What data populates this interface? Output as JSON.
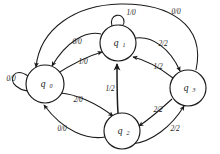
{
  "diagram": {
    "type": "mealy-state-machine",
    "background_color": "#ffffff",
    "stroke_color": "#1a1a1a",
    "states": [
      {
        "id": "q0",
        "label": "q",
        "subscript": "0",
        "cx": 45,
        "cy": 84,
        "r": 19
      },
      {
        "id": "q1",
        "label": "q",
        "subscript": "1",
        "cx": 118,
        "cy": 43,
        "r": 18
      },
      {
        "id": "q2",
        "label": "q",
        "subscript": "2",
        "cx": 122,
        "cy": 131,
        "r": 18
      },
      {
        "id": "q3",
        "label": "q",
        "subscript": "3",
        "cx": 188,
        "cy": 88,
        "r": 18
      }
    ],
    "transitions": [
      {
        "id": "t-q0-q0",
        "from": "q0",
        "to": "q0",
        "label": "0/0",
        "lx": 11,
        "ly": 79
      },
      {
        "id": "t-q1-q1",
        "from": "q1",
        "to": "q1",
        "label": "1/0",
        "lx": 131,
        "ly": 13
      },
      {
        "id": "t-q1-q0",
        "from": "q1",
        "to": "q0",
        "label": "0/0",
        "lx": 77,
        "ly": 42
      },
      {
        "id": "t-q0-q1",
        "from": "q0",
        "to": "q1",
        "label": "1/0",
        "lx": 83,
        "ly": 62
      },
      {
        "id": "t-q1-q3",
        "from": "q1",
        "to": "q3",
        "label": "2/2",
        "lx": 163,
        "ly": 44
      },
      {
        "id": "t-q3-q1",
        "from": "q3",
        "to": "q1",
        "label": "1/2",
        "lx": 158,
        "ly": 67
      },
      {
        "id": "t-q0-q2",
        "from": "q0",
        "to": "q2",
        "label": "2/0",
        "lx": 78,
        "ly": 100
      },
      {
        "id": "t-q2-q0",
        "from": "q2",
        "to": "q0",
        "label": "0/0",
        "lx": 62,
        "ly": 129
      },
      {
        "id": "t-q2-q1",
        "from": "q2",
        "to": "q1",
        "label": "1/2",
        "lx": 110,
        "ly": 89
      },
      {
        "id": "t-q3-q2",
        "from": "q3",
        "to": "q2",
        "label": "2/2",
        "lx": 158,
        "ly": 110
      },
      {
        "id": "t-q2-q3",
        "from": "q2",
        "to": "q3",
        "label": "2/2",
        "lx": 175,
        "ly": 129
      },
      {
        "id": "t-q3-q0",
        "from": "q3",
        "to": "q0",
        "label": "0/0",
        "lx": 176,
        "ly": 12
      }
    ]
  }
}
